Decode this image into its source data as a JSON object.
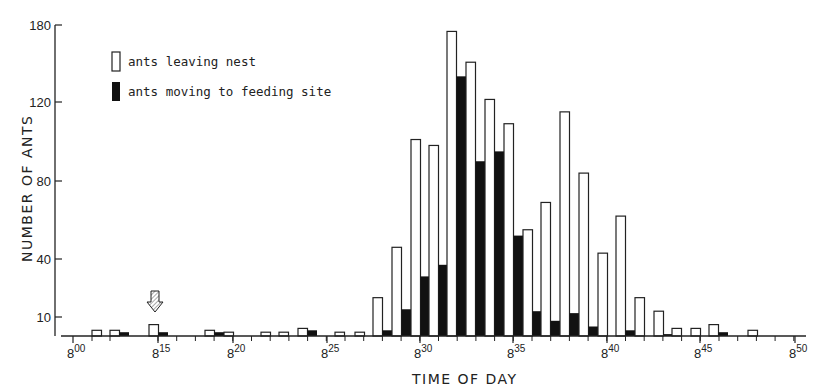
{
  "chart_data": {
    "type": "bar",
    "title": "",
    "xlabel": "TIME OF DAY",
    "ylabel": "NUMBER OF ANTS",
    "y_ticks": [
      10,
      40,
      80,
      120,
      180
    ],
    "x_ticks": [
      {
        "hour": "8",
        "min": "00"
      },
      {
        "hour": "8",
        "min": "15"
      },
      {
        "hour": "8",
        "min": "20"
      },
      {
        "hour": "8",
        "min": "25"
      },
      {
        "hour": "8",
        "min": "30"
      },
      {
        "hour": "8",
        "min": "35"
      },
      {
        "hour": "8",
        "min": "40"
      },
      {
        "hour": "8",
        "min": "45"
      },
      {
        "hour": "8",
        "min": "50"
      }
    ],
    "grid": false,
    "legend_position": "upper-left",
    "annotations": [
      {
        "type": "arrow-down",
        "at": "8:15"
      }
    ],
    "series": [
      {
        "name": "ants leaving nest",
        "style": "white",
        "values": [
          3,
          3,
          6,
          3,
          2,
          2,
          2,
          4,
          2,
          2,
          20,
          46,
          101,
          98,
          175,
          151,
          122,
          109,
          55,
          69,
          115,
          84,
          43,
          62,
          20,
          13,
          4,
          4,
          6,
          3
        ]
      },
      {
        "name": "ants moving to feeding site",
        "style": "black",
        "values": [
          0,
          2,
          2,
          2,
          0,
          0,
          0,
          3,
          0,
          0,
          3,
          14,
          31,
          37,
          140,
          90,
          95,
          52,
          13,
          8,
          12,
          5,
          0,
          3,
          0,
          1,
          0,
          0,
          2,
          0
        ]
      }
    ],
    "categories": [
      "8:01",
      "8:02",
      "8:15",
      "8:19",
      "8:20",
      "8:21",
      "8:22",
      "8:23",
      "8:25",
      "8:26",
      "8:27",
      "8:28",
      "8:29",
      "8:30",
      "8:31",
      "8:32",
      "8:33",
      "8:34",
      "8:35",
      "8:36",
      "8:37",
      "8:38",
      "8:39",
      "8:40",
      "8:41",
      "8:42",
      "8:43",
      "8:44",
      "8:45",
      "8:47"
    ]
  },
  "legend": {
    "item1": "ants leaving nest",
    "item2": "ants moving to feeding site"
  },
  "axes": {
    "xlabel": "TIME OF DAY",
    "ylabel": "NUMBER OF ANTS"
  },
  "layout": {
    "bar_x_px": [
      92,
      110,
      149,
      205,
      224,
      261,
      279,
      298,
      335,
      355,
      373,
      392,
      411,
      429,
      447,
      466,
      485,
      504,
      523,
      541,
      560,
      579,
      598,
      616,
      635,
      654,
      672,
      691,
      709,
      748
    ],
    "x_tick_px": [
      73,
      158,
      233,
      327,
      420,
      513,
      607,
      700,
      795
    ],
    "y_tick_px": [
      317,
      259,
      181,
      102,
      25
    ],
    "baseline_px": 336,
    "bar_width_px": 9.5
  }
}
